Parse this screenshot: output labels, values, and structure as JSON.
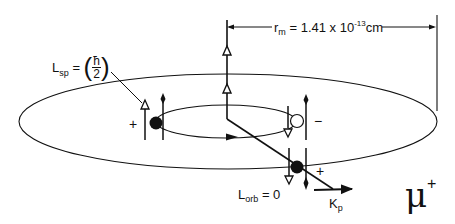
{
  "diagram": {
    "radius_label": {
      "symbol": "r",
      "subscript": "m",
      "equals": "= 1.41 x 10",
      "exponent": "-13",
      "unit": "cm"
    },
    "spin_label": {
      "symbol": "L",
      "subscript": "sp",
      "equals": "=",
      "paren_open": "(",
      "numerator": "ħ",
      "denominator": "2",
      "paren_close": ")"
    },
    "orbital_label": {
      "symbol": "L",
      "subscript": "orb",
      "equals": "=",
      "value": "0"
    },
    "momentum_label": {
      "symbol": "K",
      "subscript": "p"
    },
    "particle_label": {
      "symbol": "μ",
      "charge": "+"
    },
    "charges": {
      "left_particle": "+",
      "right_particle": "−",
      "bottom_particle": "+"
    },
    "colors": {
      "line": "#111111",
      "background": "#ffffff"
    }
  }
}
